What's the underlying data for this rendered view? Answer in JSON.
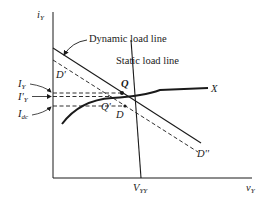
{
  "diagram": {
    "title": "",
    "axes": {
      "y_label": "i",
      "y_label_sub": "Y",
      "x_label": "v",
      "x_label_sub": "Y"
    },
    "labels": {
      "dynamic_load_line": "Dynamic load line",
      "static_load_line": "Static load line",
      "curve_end": "X",
      "point_q": "Q",
      "point_q_prime": "Q'",
      "point_d": "D",
      "point_d_prime": "D'",
      "point_d_double_prime": "D''",
      "i_y": "I",
      "i_y_sub": "Y",
      "i_y_prime": "I'",
      "i_y_prime_sub": "Y",
      "i_dc": "I",
      "i_dc_sub": "dc",
      "v_yy": "V",
      "v_yy_sub": "YY"
    },
    "colors": {
      "ink": "#1a1a1a",
      "background": "#ffffff"
    }
  }
}
